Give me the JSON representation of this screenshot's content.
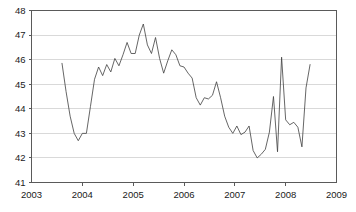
{
  "chart_data": {
    "type": "line",
    "title": "",
    "subtitle": "",
    "xlabel": "",
    "ylabel": "",
    "xlim": [
      2003,
      2009
    ],
    "ylim": [
      41,
      48
    ],
    "grid": true,
    "legend": false,
    "x_ticks": [
      "2003",
      "2004",
      "2005",
      "2006",
      "2007",
      "2008",
      "2009"
    ],
    "x_tick_values": [
      2003,
      2004,
      2005,
      2006,
      2007,
      2008,
      2009
    ],
    "y_ticks": [
      "41",
      "42",
      "43",
      "44",
      "45",
      "46",
      "47",
      "48"
    ],
    "y_tick_values": [
      41,
      42,
      43,
      44,
      45,
      46,
      47,
      48
    ],
    "series": [
      {
        "name": "series-1",
        "color": "#3f3f3f",
        "x": [
          2003.6,
          2003.68,
          2003.76,
          2003.84,
          2003.92,
          2004.0,
          2004.08,
          2004.16,
          2004.24,
          2004.32,
          2004.4,
          2004.48,
          2004.56,
          2004.64,
          2004.72,
          2004.8,
          2004.88,
          2004.96,
          2005.04,
          2005.12,
          2005.2,
          2005.28,
          2005.36,
          2005.44,
          2005.52,
          2005.6,
          2005.68,
          2005.76,
          2005.84,
          2005.92,
          2006.0,
          2006.08,
          2006.16,
          2006.24,
          2006.32,
          2006.4,
          2006.48,
          2006.56,
          2006.64,
          2006.72,
          2006.8,
          2006.88,
          2006.96,
          2007.04,
          2007.12,
          2007.2,
          2007.28,
          2007.36,
          2007.44,
          2007.52,
          2007.6,
          2007.68,
          2007.76,
          2007.84,
          2007.92,
          2008.0,
          2008.08,
          2008.16,
          2008.24,
          2008.32,
          2008.4,
          2008.48
        ],
        "y": [
          45.85,
          44.7,
          43.7,
          43.0,
          42.7,
          43.0,
          43.0,
          44.1,
          45.2,
          45.7,
          45.35,
          45.8,
          45.5,
          46.05,
          45.75,
          46.2,
          46.7,
          46.25,
          46.25,
          47.0,
          47.45,
          46.6,
          46.25,
          46.9,
          46.05,
          45.45,
          45.95,
          46.4,
          46.2,
          45.75,
          45.7,
          45.45,
          45.25,
          44.45,
          44.15,
          44.45,
          44.4,
          44.55,
          45.1,
          44.45,
          43.7,
          43.25,
          43.0,
          43.3,
          42.95,
          43.05,
          43.3,
          42.3,
          42.0,
          42.15,
          42.35,
          43.05,
          44.5,
          42.25,
          46.1,
          43.55,
          43.35,
          43.45,
          43.25,
          42.45,
          44.85,
          45.8
        ]
      }
    ]
  },
  "axes": {
    "x_axis_name": "year-axis",
    "y_axis_name": "value-axis"
  }
}
